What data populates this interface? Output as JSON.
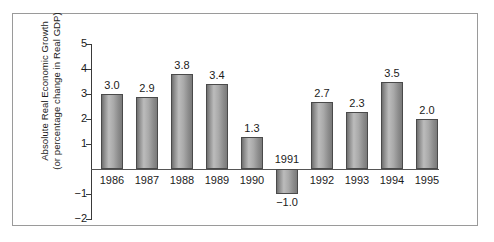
{
  "chart_data": {
    "type": "bar",
    "title": "",
    "xlabel": "",
    "ylabel": "Absolute Real Economic Growth (or percentage change in Real GDP)",
    "ylabel_lines": [
      "Absolute Real Economic Growth",
      "(or percentage change in Real GDP)"
    ],
    "categories": [
      "1986",
      "1987",
      "1988",
      "1989",
      "1990",
      "1991",
      "1992",
      "1993",
      "1994",
      "1995"
    ],
    "values": [
      3.0,
      2.9,
      3.8,
      3.4,
      1.3,
      -1.0,
      2.7,
      2.3,
      3.5,
      2.0
    ],
    "value_labels": [
      "3.0",
      "2.9",
      "3.8",
      "3.4",
      "1.3",
      "−1.0",
      "2.7",
      "2.3",
      "3.5",
      "2.0"
    ],
    "ylim": [
      -2,
      5
    ],
    "ytick_values": [
      5,
      4,
      3,
      2,
      1,
      -1,
      -2
    ],
    "ytick_labels": [
      "5",
      "4",
      "3",
      "2",
      "1",
      "−1",
      "−2"
    ],
    "grid": false,
    "legend": null,
    "bar_color": "#a0a0a0",
    "bar_edge_color": "#4a4a4a",
    "axis_color": "#3a3a3a",
    "frame_color": "#9a9a9a",
    "background_color": "#ffffff",
    "text_color": "#1b1b1b"
  }
}
